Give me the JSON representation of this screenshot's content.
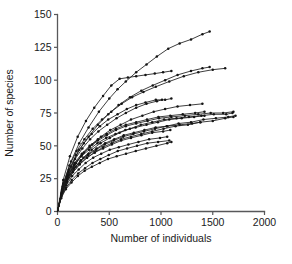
{
  "chart_data": {
    "type": "line",
    "title": "",
    "xlabel": "Number of individuals",
    "ylabel": "Number of species",
    "xlim": [
      0,
      2000
    ],
    "ylim": [
      0,
      150
    ],
    "xticks": [
      0,
      500,
      1000,
      1500,
      2000
    ],
    "yticks": [
      0,
      25,
      50,
      75,
      100,
      125,
      150
    ],
    "xtick_labels": [
      "0",
      "500",
      "1000",
      "1500",
      "2000"
    ],
    "ytick_labels": [
      "0",
      "25",
      "50",
      "75",
      "100",
      "125",
      "150"
    ],
    "grid": false,
    "legend": "none",
    "marker": "filled-circle",
    "line_color": "#141414",
    "marker_color": "#141414",
    "axis_color": "#58585a",
    "background_color": "#ffffff",
    "series": [
      {
        "name": "site-01",
        "x": [
          0,
          60,
          130,
          210,
          300,
          400,
          500,
          580,
          660,
          760,
          860,
          960,
          1070,
          1180,
          1290,
          1400,
          1470
        ],
        "y": [
          0,
          22,
          38,
          52,
          64,
          76,
          86,
          93,
          99,
          106,
          112,
          118,
          124,
          128,
          131,
          135,
          137
        ]
      },
      {
        "name": "site-02",
        "x": [
          0,
          55,
          120,
          195,
          275,
          355,
          440,
          520,
          600,
          680,
          760,
          850,
          940,
          1020,
          1100
        ],
        "y": [
          0,
          24,
          42,
          57,
          69,
          79,
          88,
          96,
          101,
          102,
          103,
          104,
          105,
          106,
          107
        ]
      },
      {
        "name": "site-03",
        "x": [
          0,
          60,
          130,
          210,
          300,
          390,
          490,
          590,
          700,
          810,
          920,
          1040,
          1160,
          1290,
          1400,
          1470
        ],
        "y": [
          0,
          20,
          34,
          47,
          57,
          66,
          74,
          81,
          87,
          92,
          96,
          100,
          104,
          107,
          109,
          110
        ]
      },
      {
        "name": "site-04",
        "x": [
          0,
          55,
          115,
          185,
          260,
          340,
          430,
          520,
          620,
          720,
          830,
          950,
          1080,
          1220,
          1360,
          1500,
          1620
        ],
        "y": [
          0,
          21,
          35,
          46,
          55,
          63,
          70,
          76,
          82,
          87,
          91,
          95,
          99,
          103,
          106,
          108,
          109
        ]
      },
      {
        "name": "site-05",
        "x": [
          0,
          50,
          110,
          180,
          255,
          330,
          410,
          490,
          580,
          670,
          760,
          850,
          950,
          1040,
          1100
        ],
        "y": [
          0,
          19,
          32,
          43,
          52,
          59,
          65,
          70,
          74,
          78,
          81,
          83,
          85,
          85,
          86
        ]
      },
      {
        "name": "site-06",
        "x": [
          0,
          50,
          105,
          170,
          240,
          315,
          395,
          480,
          570,
          660,
          760,
          860,
          960,
          1010
        ],
        "y": [
          0,
          18,
          30,
          40,
          48,
          55,
          61,
          66,
          71,
          75,
          79,
          82,
          84,
          85
        ]
      },
      {
        "name": "site-07",
        "x": [
          0,
          50,
          110,
          180,
          255,
          335,
          420,
          510,
          610,
          710,
          820,
          930,
          1040,
          1160,
          1280,
          1400
        ],
        "y": [
          0,
          17,
          28,
          37,
          45,
          51,
          57,
          62,
          66,
          70,
          73,
          76,
          78,
          80,
          81,
          82
        ]
      },
      {
        "name": "site-08",
        "x": [
          0,
          45,
          100,
          165,
          235,
          310,
          390,
          475,
          565,
          660,
          760,
          870,
          980,
          1100,
          1230,
          1360,
          1480,
          1600,
          1700
        ],
        "y": [
          0,
          16,
          27,
          36,
          43,
          49,
          54,
          58,
          62,
          65,
          67,
          69,
          71,
          72,
          73,
          74,
          75,
          75,
          76
        ]
      },
      {
        "name": "site-09",
        "x": [
          0,
          48,
          105,
          175,
          250,
          330,
          415,
          505,
          600,
          700,
          805,
          915,
          1030,
          1150,
          1270,
          1390,
          1510,
          1630,
          1690
        ],
        "y": [
          0,
          15,
          26,
          34,
          41,
          47,
          52,
          56,
          60,
          63,
          66,
          68,
          70,
          71,
          72,
          73,
          74,
          74,
          75
        ]
      },
      {
        "name": "site-10",
        "x": [
          0,
          45,
          100,
          165,
          235,
          310,
          390,
          475,
          565,
          660,
          760,
          865,
          975,
          1090,
          1210,
          1330,
          1420
        ],
        "y": [
          0,
          17,
          28,
          37,
          44,
          50,
          55,
          59,
          63,
          66,
          68,
          70,
          72,
          73,
          74,
          75,
          76
        ]
      },
      {
        "name": "site-11",
        "x": [
          0,
          45,
          95,
          160,
          230,
          305,
          385,
          470,
          560,
          655,
          755,
          860,
          970,
          1080,
          1200,
          1320,
          1420
        ],
        "y": [
          0,
          16,
          27,
          35,
          42,
          47,
          52,
          56,
          59,
          62,
          64,
          66,
          68,
          70,
          71,
          72,
          73
        ]
      },
      {
        "name": "site-12",
        "x": [
          0,
          42,
          92,
          155,
          222,
          295,
          372,
          455,
          542,
          635,
          732,
          835,
          942,
          1055,
          1170,
          1290,
          1410,
          1530,
          1650,
          1720
        ],
        "y": [
          0,
          14,
          24,
          32,
          38,
          43,
          47,
          51,
          54,
          57,
          59,
          61,
          63,
          65,
          67,
          68,
          70,
          71,
          72,
          73
        ]
      },
      {
        "name": "site-13",
        "x": [
          0,
          40,
          90,
          150,
          215,
          285,
          360,
          440,
          525,
          615,
          710,
          810,
          915,
          1025,
          1140,
          1260,
          1380,
          1500,
          1620,
          1700
        ],
        "y": [
          0,
          13,
          22,
          30,
          36,
          41,
          45,
          49,
          52,
          55,
          57,
          59,
          61,
          63,
          65,
          66,
          68,
          69,
          71,
          72
        ]
      },
      {
        "name": "site-14",
        "x": [
          0,
          42,
          95,
          158,
          226,
          300,
          378,
          460,
          548,
          640,
          738,
          840,
          948,
          1060,
          1180,
          1300,
          1380
        ],
        "y": [
          0,
          15,
          25,
          33,
          39,
          44,
          48,
          52,
          55,
          58,
          60,
          62,
          64,
          65,
          66,
          67,
          68
        ]
      },
      {
        "name": "site-15",
        "x": [
          0,
          40,
          90,
          150,
          215,
          285,
          360,
          440,
          525,
          615,
          710,
          810,
          915,
          1020,
          1090
        ],
        "y": [
          0,
          14,
          23,
          30,
          36,
          41,
          45,
          48,
          51,
          54,
          56,
          58,
          60,
          61,
          62
        ]
      },
      {
        "name": "site-16",
        "x": [
          0,
          38,
          85,
          142,
          205,
          272,
          345,
          422,
          505,
          592,
          685,
          782,
          885,
          990,
          1060
        ],
        "y": [
          0,
          12,
          20,
          27,
          32,
          37,
          41,
          44,
          47,
          49,
          51,
          53,
          55,
          56,
          57
        ]
      },
      {
        "name": "site-17",
        "x": [
          0,
          36,
          82,
          138,
          200,
          266,
          338,
          414,
          495,
          582,
          672,
          768,
          868,
          972,
          1080
        ],
        "y": [
          0,
          11,
          18,
          24,
          29,
          33,
          37,
          40,
          43,
          46,
          48,
          50,
          52,
          53,
          54
        ]
      },
      {
        "name": "site-18",
        "x": [
          0,
          35,
          80,
          135,
          196,
          262,
          332,
          408,
          488,
          572,
          662,
          756,
          854,
          956,
          1060,
          1100
        ],
        "y": [
          0,
          10,
          17,
          22,
          27,
          31,
          34,
          37,
          40,
          42,
          44,
          46,
          48,
          50,
          52,
          53
        ]
      }
    ]
  }
}
